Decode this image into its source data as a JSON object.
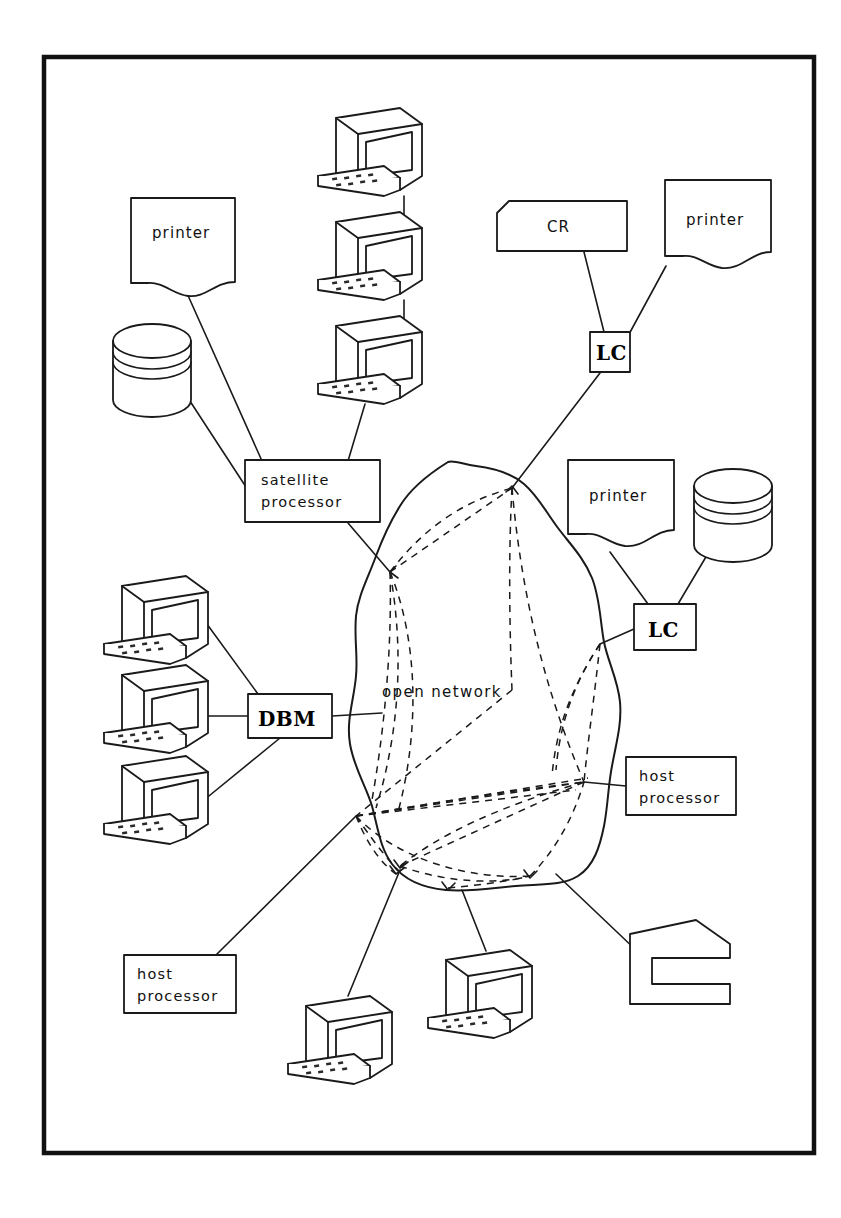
{
  "diagram": {
    "network_label": "open network",
    "frame": {
      "x": 42,
      "y": 55,
      "width": 774,
      "height": 1100
    },
    "colors": {
      "ink": "#1a1a1a",
      "frame": "#111111",
      "background": "#ffffff"
    },
    "nodes": [
      {
        "id": "printer-top-left",
        "type": "printer",
        "label": "printer",
        "x": 131,
        "y": 198,
        "w": 104,
        "h": 92
      },
      {
        "id": "disk-top-left",
        "type": "disk",
        "label": "",
        "x": 113,
        "y": 325,
        "w": 78,
        "h": 96
      },
      {
        "id": "terminal-stack-1",
        "type": "terminal",
        "label": "",
        "x": 318,
        "y": 108,
        "w": 104,
        "h": 84
      },
      {
        "id": "terminal-stack-2",
        "type": "terminal",
        "label": "",
        "x": 318,
        "y": 212,
        "w": 104,
        "h": 84
      },
      {
        "id": "terminal-stack-3",
        "type": "terminal",
        "label": "",
        "x": 318,
        "y": 316,
        "w": 104,
        "h": 84
      },
      {
        "id": "satellite-processor",
        "type": "box",
        "label": "satellite processor",
        "label_lines": [
          "satellite",
          "processor"
        ],
        "x": 245,
        "y": 460,
        "w": 135,
        "h": 62
      },
      {
        "id": "card-reader",
        "type": "clipped-box",
        "label": "CR",
        "x": 497,
        "y": 201,
        "w": 130,
        "h": 50
      },
      {
        "id": "printer-top-right",
        "type": "printer",
        "label": "printer",
        "x": 665,
        "y": 180,
        "w": 106,
        "h": 92
      },
      {
        "id": "line-controller-top",
        "type": "box",
        "label": "LC",
        "x": 590,
        "y": 332,
        "w": 40,
        "h": 40
      },
      {
        "id": "printer-mid-right",
        "type": "printer",
        "label": "printer",
        "x": 568,
        "y": 460,
        "w": 106,
        "h": 92
      },
      {
        "id": "disk-mid-right",
        "type": "disk",
        "label": "",
        "x": 694,
        "y": 470,
        "w": 78,
        "h": 96
      },
      {
        "id": "line-controller-mid",
        "type": "box",
        "label": "LC",
        "x": 634,
        "y": 604,
        "w": 62,
        "h": 46
      },
      {
        "id": "terminal-left-1",
        "type": "terminal",
        "label": "",
        "x": 104,
        "y": 576,
        "w": 104,
        "h": 84
      },
      {
        "id": "terminal-left-2",
        "type": "terminal",
        "label": "",
        "x": 104,
        "y": 665,
        "w": 104,
        "h": 84
      },
      {
        "id": "terminal-left-3",
        "type": "terminal",
        "label": "",
        "x": 104,
        "y": 756,
        "w": 104,
        "h": 84
      },
      {
        "id": "database-machine",
        "type": "box",
        "label": "DBM",
        "x": 248,
        "y": 694,
        "w": 84,
        "h": 44
      },
      {
        "id": "host-processor-right",
        "type": "box",
        "label": "host processor",
        "label_lines": [
          "host",
          "processor"
        ],
        "x": 626,
        "y": 757,
        "w": 110,
        "h": 58
      },
      {
        "id": "host-processor-bottom",
        "type": "box",
        "label": "host processor",
        "label_lines": [
          "host",
          "processor"
        ],
        "x": 124,
        "y": 955,
        "w": 112,
        "h": 58
      },
      {
        "id": "terminal-bottom-1",
        "type": "terminal",
        "label": "",
        "x": 288,
        "y": 996,
        "w": 104,
        "h": 84
      },
      {
        "id": "terminal-bottom-2",
        "type": "terminal",
        "label": "",
        "x": 428,
        "y": 950,
        "w": 104,
        "h": 84
      },
      {
        "id": "console-symbol",
        "type": "c-shape",
        "label": "",
        "x": 630,
        "y": 920,
        "w": 100,
        "h": 84
      }
    ],
    "edges": [
      {
        "from": "printer-top-left",
        "to": "satellite-processor"
      },
      {
        "from": "disk-top-left",
        "to": "satellite-processor"
      },
      {
        "from": "terminal-stack-1",
        "to": "terminal-stack-2"
      },
      {
        "from": "terminal-stack-2",
        "to": "terminal-stack-3"
      },
      {
        "from": "terminal-stack-3",
        "to": "satellite-processor"
      },
      {
        "from": "satellite-processor",
        "to": "open-network"
      },
      {
        "from": "card-reader",
        "to": "line-controller-top"
      },
      {
        "from": "printer-top-right",
        "to": "line-controller-top"
      },
      {
        "from": "line-controller-top",
        "to": "open-network"
      },
      {
        "from": "printer-mid-right",
        "to": "line-controller-mid"
      },
      {
        "from": "disk-mid-right",
        "to": "line-controller-mid"
      },
      {
        "from": "line-controller-mid",
        "to": "open-network"
      },
      {
        "from": "terminal-left-1",
        "to": "database-machine"
      },
      {
        "from": "terminal-left-2",
        "to": "database-machine"
      },
      {
        "from": "terminal-left-3",
        "to": "database-machine"
      },
      {
        "from": "database-machine",
        "to": "open-network"
      },
      {
        "from": "open-network",
        "to": "host-processor-right"
      },
      {
        "from": "open-network",
        "to": "host-processor-bottom"
      },
      {
        "from": "open-network",
        "to": "terminal-bottom-1"
      },
      {
        "from": "open-network",
        "to": "terminal-bottom-2"
      },
      {
        "from": "open-network",
        "to": "console-symbol"
      }
    ]
  }
}
